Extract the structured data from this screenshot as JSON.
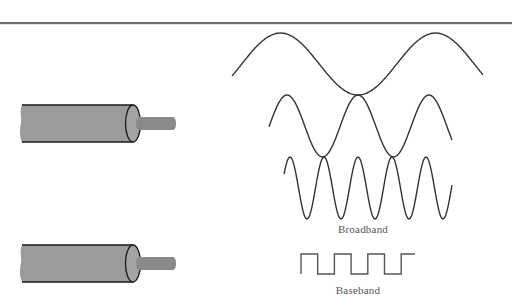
{
  "diagram": {
    "type": "broadband-vs-baseband-transmission",
    "colors": {
      "rule": "#6e6e6e",
      "cable_body": "#9c9c9c",
      "cable_end": "#a4a4a4",
      "cable_outline": "#1a1a1a",
      "conductor": "#8a8a8a",
      "wave_stroke": "#333333",
      "label_text": "#555555"
    },
    "cables": [
      {
        "name": "broadband-cable",
        "y_top": 104,
        "y_bottom": 142
      },
      {
        "name": "baseband-cable",
        "y_top": 244,
        "y_bottom": 282
      }
    ],
    "signals": {
      "broadband": {
        "label": "Broadband",
        "waves": [
          {
            "name": "low-frequency-carrier",
            "x_start": 232,
            "x_end": 483,
            "center_y": 64,
            "amplitude": 31,
            "period": 155
          },
          {
            "name": "mid-frequency-carrier",
            "x_start": 269,
            "x_end": 452,
            "center_y": 126,
            "amplitude": 31,
            "period": 71
          },
          {
            "name": "high-frequency-carrier",
            "x_start": 284,
            "x_end": 452,
            "center_y": 188,
            "amplitude": 31,
            "period": 34
          }
        ]
      },
      "baseband": {
        "label": "Baseband",
        "square_wave": {
          "x_start": 301,
          "x_end": 415,
          "y_high": 254,
          "y_low": 274,
          "half_period": 16.7
        }
      }
    }
  }
}
